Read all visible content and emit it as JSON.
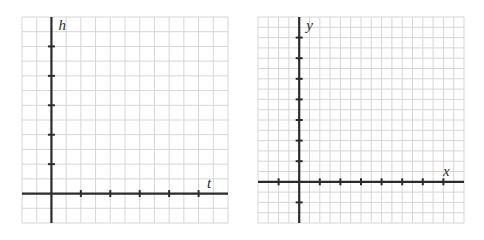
{
  "graphs": [
    {
      "name": "height-vs-time-grid",
      "x_label": "t",
      "y_label": "h",
      "bounds": {
        "left": 22,
        "top": 17,
        "width": 206,
        "height": 206
      },
      "cols": 14,
      "rows": 14,
      "origin_col": 2,
      "origin_row": 12,
      "tick_every": 2,
      "x_ticks": [
        1,
        2,
        3,
        4,
        5
      ],
      "y_ticks": [
        1,
        2,
        3,
        4,
        5
      ]
    },
    {
      "name": "xy-coordinate-grid",
      "x_label": "x",
      "y_label": "y",
      "bounds": {
        "left": 258,
        "top": 17,
        "width": 206,
        "height": 206
      },
      "cols": 20,
      "rows": 20,
      "origin_col": 4,
      "origin_row": 16,
      "tick_every": 2,
      "x_ticks": [
        -1,
        1,
        2,
        3,
        4,
        5,
        6,
        7
      ],
      "y_ticks": [
        -1,
        1,
        2,
        3,
        4,
        5,
        6,
        7
      ]
    }
  ],
  "colors": {
    "grid": "#d6d6d6",
    "axis": "#2b2b2b",
    "background": "#ffffff"
  }
}
